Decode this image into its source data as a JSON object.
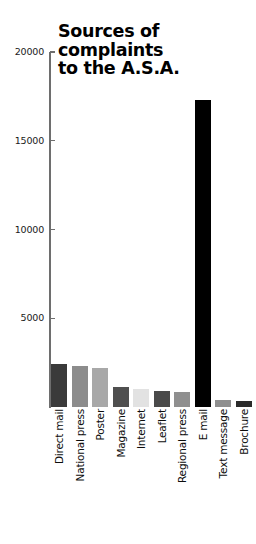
{
  "chart_data": {
    "type": "bar",
    "title": "Sources of\ncomplaints\nto the A.S.A.",
    "title_flat": "Sources of complaints to the A.S.A.",
    "xlabel": "",
    "ylabel": "",
    "ylim": [
      0,
      20000
    ],
    "grid": false,
    "legend": "none",
    "y_ticks": [
      20000,
      15000,
      10000,
      5000
    ],
    "y_tick_labels": [
      "20000",
      "15000",
      "10000",
      "5000"
    ],
    "categories": [
      "Direct mail",
      "National press",
      "Poster",
      "Magazine",
      "Internet",
      "Leaflet",
      "Regional press",
      "E mail",
      "Text message",
      "Brochure"
    ],
    "values": [
      2400,
      2300,
      2200,
      1100,
      1000,
      900,
      850,
      17300,
      400,
      350
    ],
    "bar_colors": [
      "#3a3a3a",
      "#8c8c8c",
      "#a8a8a8",
      "#4f4f4f",
      "#e2e2e2",
      "#4a4a4a",
      "#8f8f8f",
      "#000000",
      "#8f8f8f",
      "#2b2b2b"
    ],
    "axis_color": "#6e6e6e"
  }
}
